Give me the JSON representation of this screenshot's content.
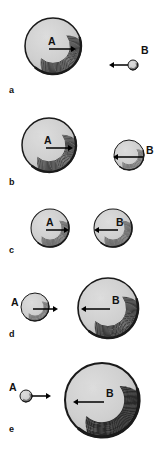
{
  "figure": {
    "width": 154,
    "height": 453,
    "background_color": "#ffffff",
    "sphere_fill_color": "#cfcfcf",
    "sphere_outline_color": "#1a1a1a",
    "shading_color": "#222222",
    "arrow_color": "#000000",
    "label_color": "#111111"
  },
  "rows": [
    {
      "key": "a",
      "row_label": "a",
      "row_label_x": 9,
      "row_label_y": 86,
      "objects": [
        {
          "id": "a-A",
          "label": "A",
          "label_x": 48,
          "label_y": 38,
          "cx": 53,
          "cy": 46,
          "r": 28,
          "arrow": {
            "x1": 49,
            "y1": 49,
            "x2": 76,
            "y2": 49,
            "direction": "right"
          }
        },
        {
          "id": "a-B",
          "label": "B",
          "label_x": 141,
          "label_y": 47,
          "cx": 133,
          "cy": 65,
          "r": 5,
          "arrow": {
            "x1": 128,
            "y1": 65,
            "x2": 109,
            "y2": 65,
            "direction": "left"
          }
        }
      ]
    },
    {
      "key": "b",
      "row_label": "b",
      "row_label_x": 9,
      "row_label_y": 178,
      "objects": [
        {
          "id": "b-A",
          "label": "A",
          "label_x": 44,
          "label_y": 137,
          "cx": 49,
          "cy": 145,
          "r": 27,
          "arrow": {
            "x1": 46,
            "y1": 148,
            "x2": 73,
            "y2": 148,
            "direction": "right"
          }
        },
        {
          "id": "b-B",
          "label": "B",
          "label_x": 146,
          "label_y": 147,
          "cx": 129,
          "cy": 155,
          "r": 15,
          "arrow": {
            "x1": 143,
            "y1": 157,
            "x2": 113,
            "y2": 157,
            "direction": "left"
          }
        }
      ]
    },
    {
      "key": "c",
      "row_label": "c",
      "row_label_x": 9,
      "row_label_y": 246,
      "objects": [
        {
          "id": "c-A",
          "label": "A",
          "label_x": 46,
          "label_y": 219,
          "cx": 50,
          "cy": 228,
          "r": 19,
          "arrow": {
            "x1": 46,
            "y1": 230,
            "x2": 69,
            "y2": 230,
            "direction": "right"
          }
        },
        {
          "id": "c-B",
          "label": "B",
          "label_x": 116,
          "label_y": 219,
          "cx": 113,
          "cy": 228,
          "r": 19,
          "arrow": {
            "x1": 118,
            "y1": 230,
            "x2": 94,
            "y2": 230,
            "direction": "left"
          }
        }
      ]
    },
    {
      "key": "d",
      "row_label": "d",
      "row_label_x": 9,
      "row_label_y": 330,
      "objects": [
        {
          "id": "d-A",
          "label": "A",
          "label_x": 11,
          "label_y": 299,
          "cx": 35,
          "cy": 307,
          "r": 14,
          "arrow": {
            "x1": 33,
            "y1": 309,
            "x2": 58,
            "y2": 309,
            "direction": "right"
          }
        },
        {
          "id": "d-B",
          "label": "B",
          "label_x": 112,
          "label_y": 297,
          "cx": 108,
          "cy": 308,
          "r": 30,
          "arrow": {
            "x1": 110,
            "y1": 309,
            "x2": 81,
            "y2": 309,
            "direction": "left"
          }
        }
      ]
    },
    {
      "key": "e",
      "row_label": "e",
      "row_label_x": 9,
      "row_label_y": 425,
      "objects": [
        {
          "id": "e-A",
          "label": "A",
          "label_x": 9,
          "label_y": 384,
          "cx": 26,
          "cy": 396,
          "r": 6,
          "arrow": {
            "x1": 32,
            "y1": 396,
            "x2": 51,
            "y2": 396,
            "direction": "right"
          }
        },
        {
          "id": "e-B",
          "label": "B",
          "label_x": 106,
          "label_y": 390,
          "cx": 102,
          "cy": 400,
          "r": 37,
          "arrow": {
            "x1": 104,
            "y1": 402,
            "x2": 73,
            "y2": 402,
            "direction": "left"
          }
        }
      ]
    }
  ]
}
